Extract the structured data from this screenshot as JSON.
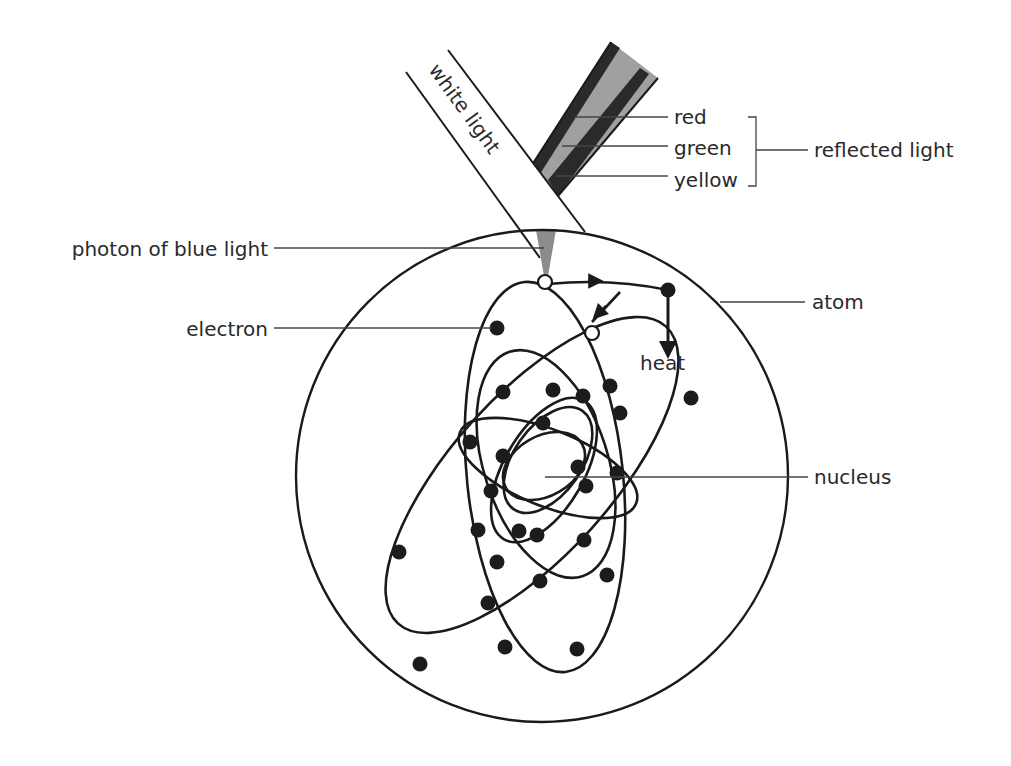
{
  "diagram": {
    "labels": {
      "white_light": "white light",
      "red": "red",
      "green": "green",
      "yellow": "yellow",
      "reflected_light": "reflected light",
      "photon": "photon of blue light",
      "electron": "electron",
      "atom": "atom",
      "heat": "heat",
      "nucleus": "nucleus"
    },
    "colors": {
      "line": "#1a1a1a",
      "reflected_beam_fill": "#9a9a9a",
      "reflected_beam_dark_band": "#2a2a2a",
      "photon_fill": "#8c8c8c",
      "background": "#ffffff"
    }
  }
}
